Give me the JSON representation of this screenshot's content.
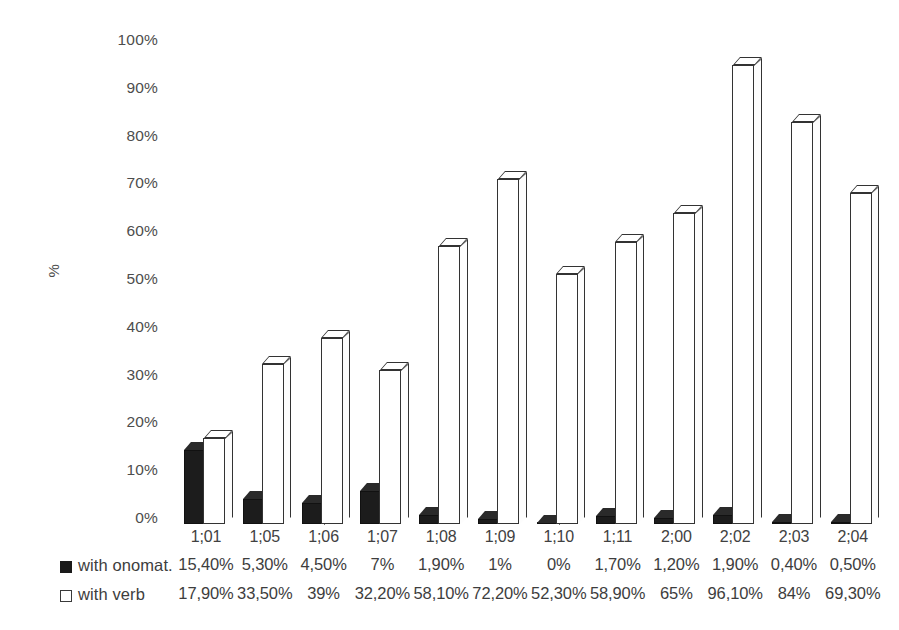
{
  "chart_data": {
    "type": "bar",
    "title": "",
    "subtitle": "",
    "xlabel": "",
    "ylabel": "%",
    "ylim": [
      0,
      100
    ],
    "grid": false,
    "legend_position": "bottom-table",
    "categories": [
      "1;01",
      "1;05",
      "1;06",
      "1;07",
      "1;08",
      "1;09",
      "1;10",
      "1;11",
      "2;00",
      "2;02",
      "2;03",
      "2;04"
    ],
    "y_ticks": [
      "0%",
      "10%",
      "20%",
      "30%",
      "40%",
      "50%",
      "60%",
      "70%",
      "80%",
      "90%",
      "100%"
    ],
    "y_tick_values": [
      0,
      10,
      20,
      30,
      40,
      50,
      60,
      70,
      80,
      90,
      100
    ],
    "series": [
      {
        "name": "with onomat.",
        "marker": "filled-square",
        "color": "#1a1a1a",
        "values": [
          15.4,
          5.3,
          4.5,
          7,
          1.9,
          1,
          0,
          1.7,
          1.2,
          1.9,
          0.4,
          0.5
        ],
        "labels": [
          "15,40%",
          "5,30%",
          "4,50%",
          "7%",
          "1,90%",
          "1%",
          "0%",
          "1,70%",
          "1,20%",
          "1,90%",
          "0,40%",
          "0,50%"
        ]
      },
      {
        "name": "with verb",
        "marker": "hollow-square",
        "color": "#ffffff",
        "values": [
          17.9,
          33.5,
          39,
          32.2,
          58.1,
          72.2,
          52.3,
          58.9,
          65,
          96.1,
          84,
          69.3
        ],
        "labels": [
          "17,90%",
          "33,50%",
          "39%",
          "32,20%",
          "58,10%",
          "72,20%",
          "52,30%",
          "58,90%",
          "65%",
          "96,10%",
          "84%",
          "69,30%"
        ]
      }
    ]
  },
  "axis": {
    "y_title": "%"
  },
  "colors": {
    "bar_fill_dark": "#1a1a1a",
    "bar_fill_light": "#ffffff",
    "bar_outline": "#333333",
    "text": "#3d3d3d",
    "background": "#ffffff"
  }
}
